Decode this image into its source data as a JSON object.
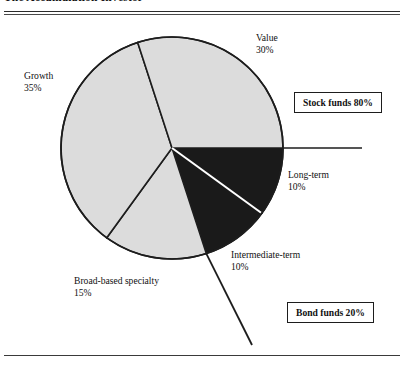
{
  "header": {
    "title": "The Accumulation Investor"
  },
  "chart_data": {
    "type": "pie",
    "title": "The Accumulation Investor",
    "total": 100,
    "units": "%",
    "start_angle_deg": 0,
    "direction": "clockwise",
    "center": [
      172,
      148
    ],
    "radius": 111,
    "legend": "none",
    "categories": [
      "Long-term",
      "Intermediate-term",
      "Broad-based specialty",
      "Growth",
      "Value"
    ],
    "values": [
      10,
      10,
      15,
      35,
      30
    ],
    "slices": [
      {
        "name": "Long-term",
        "label_line1": "Long-term",
        "label_line2": "10%",
        "value": 10,
        "color": "#1a1a1a",
        "group": "Bond funds",
        "start_deg": 0,
        "end_deg": 36
      },
      {
        "name": "Intermediate-term",
        "label_line1": "Intermediate-term",
        "label_line2": "10%",
        "value": 10,
        "color": "#1a1a1a",
        "group": "Bond funds",
        "start_deg": 36,
        "end_deg": 72
      },
      {
        "name": "Broad-based specialty",
        "label_line1": "Broad-based specialty",
        "label_line2": "15%",
        "value": 15,
        "color": "#dcdcdc",
        "group": "Stock funds",
        "start_deg": 72,
        "end_deg": 126
      },
      {
        "name": "Growth",
        "label_line1": "Growth",
        "label_line2": "35%",
        "value": 35,
        "color": "#dcdcdc",
        "group": "Stock funds",
        "start_deg": 126,
        "end_deg": 252
      },
      {
        "name": "Value",
        "label_line1": "Value",
        "label_line2": "30%",
        "value": 30,
        "color": "#dcdcdc",
        "group": "Stock funds",
        "start_deg": 252,
        "end_deg": 360
      }
    ],
    "groups": [
      {
        "name": "Stock funds",
        "label": "Stock funds 80%",
        "value": 80
      },
      {
        "name": "Bond funds",
        "label": "Bond funds 20%",
        "value": 20
      }
    ],
    "annotations": {
      "stock_box": "Stock funds 80%",
      "bond_box": "Bond funds 20%"
    }
  },
  "colors": {
    "slice_light": "#dcdcdc",
    "slice_dark": "#1a1a1a",
    "outline": "#1d1d1d",
    "rule": "#2b2b2b",
    "text": "#111111",
    "background": "#ffffff"
  }
}
